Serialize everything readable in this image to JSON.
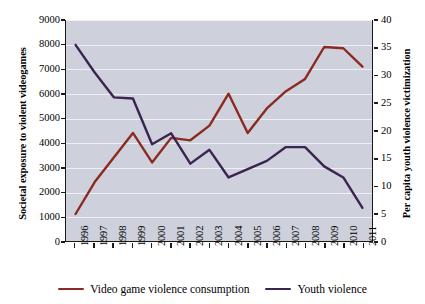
{
  "chart_data": {
    "type": "line",
    "title": "",
    "subtitle": "",
    "xlabel": "",
    "ylabel": "Societal exposure to violent videogames",
    "ylabel_right": "Per capita youth violence victimization",
    "grid": true,
    "legend_position": "bottom",
    "x": [
      1996,
      1997,
      1998,
      1999,
      2000,
      2001,
      2002,
      2003,
      2004,
      2005,
      2006,
      2007,
      2008,
      2009,
      2010,
      2011
    ],
    "categories": [
      "1996",
      "1997",
      "1998",
      "1999",
      "2000",
      "2001",
      "2002",
      "2003",
      "2004",
      "2005",
      "2006",
      "2007",
      "2008",
      "2009",
      "2010",
      "2011"
    ],
    "ylim": [
      0,
      9000
    ],
    "yticks": [
      0,
      1000,
      2000,
      3000,
      4000,
      5000,
      6000,
      7000,
      8000,
      9000
    ],
    "ytick_labels": [
      "0",
      "1000",
      "2000",
      "3000",
      "4000",
      "5000",
      "6000",
      "7000",
      "8000",
      "9000"
    ],
    "ylim_right": [
      0,
      40
    ],
    "yticks_right": [
      0,
      5,
      10,
      15,
      20,
      25,
      30,
      35,
      40
    ],
    "ytick_labels_right": [
      "0",
      "5",
      "10",
      "15",
      "20",
      "25",
      "30",
      "35",
      "40"
    ],
    "series": [
      {
        "name": "Video game violence consumption",
        "axis": "left",
        "color": "#8c2a22",
        "values": [
          1100,
          2400,
          3400,
          4400,
          3200,
          4200,
          4100,
          4700,
          6000,
          4400,
          5400,
          6100,
          6600,
          7900,
          7850,
          7100
        ]
      },
      {
        "name": "Youth violence",
        "axis": "right",
        "color": "#3b2352",
        "values": [
          35.5,
          30.5,
          26,
          25.8,
          17.5,
          19.5,
          14,
          16.5,
          11.5,
          13,
          14.5,
          17,
          17,
          13.5,
          11.5,
          6
        ]
      }
    ],
    "legend": [
      {
        "label": "Video game violence consumption",
        "color": "#8c2a22"
      },
      {
        "label": "Youth violence",
        "color": "#3b2352"
      }
    ],
    "plot_background": "#ced1dc",
    "gridline_color": "#eef0f5"
  }
}
